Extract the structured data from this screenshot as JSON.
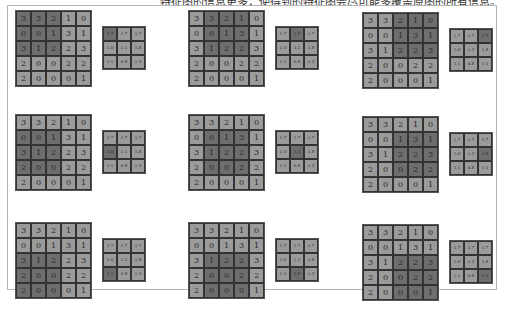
{
  "caption": "特征图的信息更多，使得到的特征图会尽可能多覆盖原图的所有信息。",
  "colors": {
    "cell": "#9b9b9b",
    "highlight": "#6e6e6e",
    "border": "#333333",
    "frame": "#b5b5b5"
  },
  "input": [
    [
      "3",
      "3",
      "2",
      "1",
      "0"
    ],
    [
      "0",
      "0",
      "1",
      "3",
      "1"
    ],
    [
      "3",
      "1",
      "2",
      "2",
      "3"
    ],
    [
      "2",
      "0",
      "0",
      "2",
      "2"
    ],
    [
      "2",
      "0",
      "0",
      "0",
      "1"
    ]
  ],
  "output": [
    [
      "1.7",
      "1.7",
      "1.7"
    ],
    [
      "1.0",
      "1.2",
      "1.8"
    ],
    [
      "1.1",
      "0.8",
      "1.3"
    ]
  ],
  "panels": [
    {
      "row": 0,
      "col": 0,
      "window_row": 0,
      "window_col": 0
    },
    {
      "row": 0,
      "col": 1,
      "window_row": 0,
      "window_col": 1
    },
    {
      "row": 0,
      "col": 2,
      "window_row": 0,
      "window_col": 2
    },
    {
      "row": 1,
      "col": 0,
      "window_row": 1,
      "window_col": 0
    },
    {
      "row": 1,
      "col": 1,
      "window_row": 1,
      "window_col": 1
    },
    {
      "row": 1,
      "col": 2,
      "window_row": 1,
      "window_col": 2
    },
    {
      "row": 2,
      "col": 0,
      "window_row": 2,
      "window_col": 0
    },
    {
      "row": 2,
      "col": 1,
      "window_row": 2,
      "window_col": 1
    },
    {
      "row": 2,
      "col": 2,
      "window_row": 2,
      "window_col": 2
    }
  ],
  "layout": {
    "panel_x": [
      15,
      188,
      362
    ],
    "panel_y": [
      10,
      114,
      222
    ],
    "panel_dy": [
      0,
      0,
      4
    ],
    "out_dx": 87,
    "out_dy": 16
  }
}
